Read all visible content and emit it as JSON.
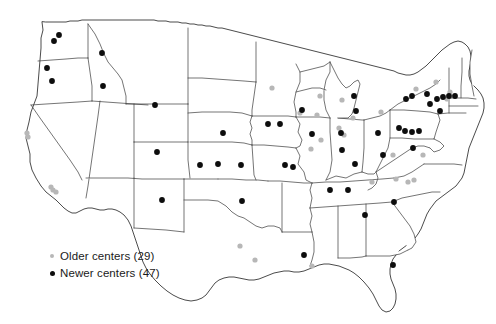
{
  "figure": {
    "type": "dot-distribution-map",
    "region": "United States (contiguous 48 states)",
    "background_color": "#ffffff",
    "outline_color": "#2b2b2b",
    "state_border_color": "#3a3a3a"
  },
  "legend": {
    "items": [
      {
        "key": "older",
        "label": "Older centers (29)",
        "marker": "small-gray-dot",
        "color": "#b7b7b7",
        "count": 29
      },
      {
        "key": "newer",
        "label": "Newer centers (47)",
        "marker": "small-black-dot",
        "color": "#0d0d0d",
        "count": 47
      }
    ]
  },
  "chart_data": {
    "type": "scatter",
    "title": "",
    "xlabel": "",
    "ylabel": "",
    "projection": "us-albers-like",
    "xlim": [
      0,
      496
    ],
    "ylim": [
      0,
      324
    ],
    "grid": false,
    "legend_position": "lower-left",
    "series": [
      {
        "name": "Older centers (29)",
        "color": "#b7b7b7",
        "radius": 2.6,
        "count": 29,
        "points": [
          [
            27,
            133
          ],
          [
            28,
            137
          ],
          [
            51,
            187
          ],
          [
            53,
            190
          ],
          [
            56,
            192
          ],
          [
            272,
            88
          ],
          [
            300,
            113
          ],
          [
            317,
            115
          ],
          [
            320,
            96
          ],
          [
            321,
            140
          ],
          [
            339,
            128
          ],
          [
            344,
            135
          ],
          [
            342,
            100
          ],
          [
            311,
            149
          ],
          [
            353,
            118
          ],
          [
            381,
            112
          ],
          [
            416,
            89
          ],
          [
            436,
            82
          ],
          [
            447,
            99
          ],
          [
            450,
            92
          ],
          [
            423,
            155
          ],
          [
            408,
            182
          ],
          [
            396,
            179
          ],
          [
            393,
            155
          ],
          [
            372,
            182
          ],
          [
            414,
            180
          ],
          [
            240,
            246
          ],
          [
            255,
            260
          ],
          [
            312,
            266
          ]
        ]
      },
      {
        "name": "Newer centers (47)",
        "color": "#0d0d0d",
        "radius": 2.9,
        "count": 47,
        "points": [
          [
            59,
            35
          ],
          [
            54,
            41
          ],
          [
            47,
            68
          ],
          [
            52,
            81
          ],
          [
            102,
            53
          ],
          [
            103,
            86
          ],
          [
            155,
            105
          ],
          [
            157,
            152
          ],
          [
            162,
            200
          ],
          [
            223,
            133
          ],
          [
            218,
            164
          ],
          [
            241,
            165
          ],
          [
            242,
            201
          ],
          [
            268,
            124
          ],
          [
            280,
            124
          ],
          [
            285,
            165
          ],
          [
            293,
            167
          ],
          [
            302,
            110
          ],
          [
            312,
            134
          ],
          [
            341,
            133
          ],
          [
            356,
            111
          ],
          [
            354,
            96
          ],
          [
            342,
            150
          ],
          [
            355,
            164
          ],
          [
            383,
            155
          ],
          [
            399,
            128
          ],
          [
            406,
            99
          ],
          [
            412,
            96
          ],
          [
            405,
            131
          ],
          [
            412,
            132
          ],
          [
            419,
            131
          ],
          [
            430,
            104
          ],
          [
            437,
            99
          ],
          [
            443,
            97
          ],
          [
            449,
            96
          ],
          [
            455,
            96
          ],
          [
            440,
            111
          ],
          [
            413,
            148
          ],
          [
            330,
            190
          ],
          [
            348,
            190
          ],
          [
            394,
            202
          ],
          [
            365,
            215
          ],
          [
            304,
            255
          ],
          [
            393,
            265
          ],
          [
            200,
            165
          ],
          [
            427,
            94
          ],
          [
            378,
            133
          ]
        ]
      }
    ]
  }
}
